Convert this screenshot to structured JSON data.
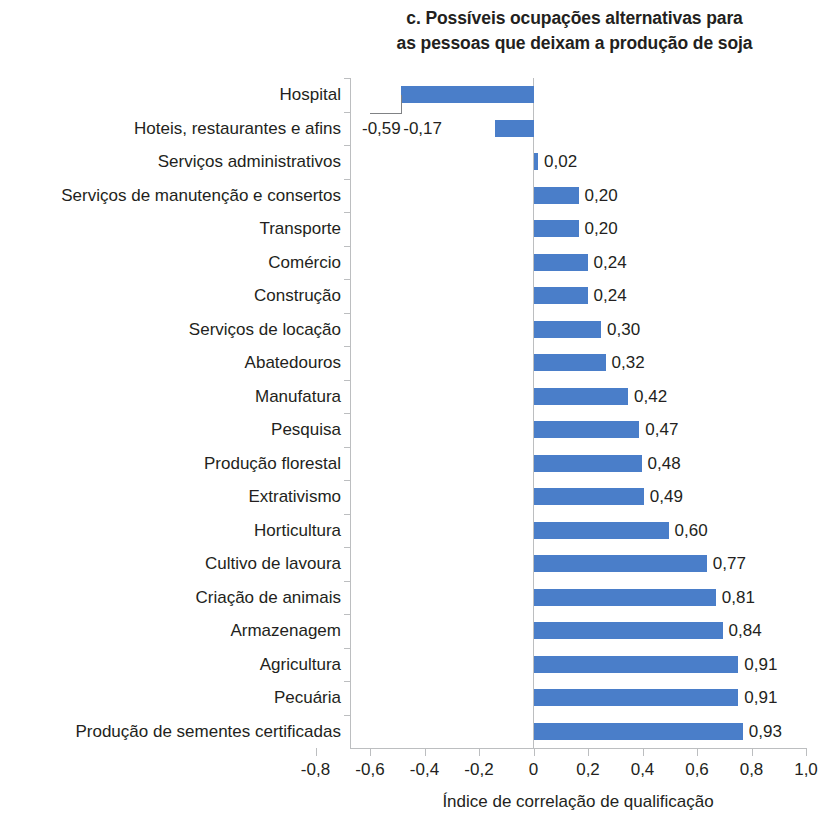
{
  "chart_data": {
    "type": "bar",
    "orientation": "horizontal",
    "title": "c. Possíveis ocupações alternativas para as pessoas que deixam a produção de soja",
    "title_lines": [
      "c. Possíveis ocupações alternativas para",
      "as pessoas que deixam a produção de soja"
    ],
    "xlabel": "Índice de correlação de qualificação",
    "ylabel": "",
    "xlim": [
      -0.8,
      1.0
    ],
    "grid": false,
    "legend": null,
    "bar_color": "#4a7ec9",
    "decimal_separator": ",",
    "xticks": [
      -0.8,
      -0.6,
      -0.4,
      -0.2,
      0,
      0.2,
      0.4,
      0.6,
      0.8,
      1.0
    ],
    "xtick_labels": [
      "-0,8",
      "-0,6",
      "-0,4",
      "-0,2",
      "0",
      "0,2",
      "0,4",
      "0,6",
      "0,8",
      "1,0"
    ],
    "categories": [
      "Hospital",
      "Hoteis, restaurantes e afins",
      "Serviços administrativos",
      "Serviços de manutenção e consertos",
      "Transporte",
      "Comércio",
      "Construção",
      "Serviços de locação",
      "Abatedouros",
      "Manufatura",
      "Pesquisa",
      "Produção florestal",
      "Extrativismo",
      "Horticultura",
      "Cultivo de lavoura",
      "Criação de animais",
      "Armazenagem",
      "Agricultura",
      "Pecuária",
      "Produção de sementes certificadas"
    ],
    "values": [
      -0.59,
      -0.17,
      0.02,
      0.2,
      0.2,
      0.24,
      0.24,
      0.3,
      0.32,
      0.42,
      0.47,
      0.48,
      0.49,
      0.6,
      0.77,
      0.81,
      0.84,
      0.91,
      0.91,
      0.93
    ],
    "value_labels": [
      "-0,59",
      "-0,17",
      "0,02",
      "0,20",
      "0,20",
      "0,24",
      "0,24",
      "0,30",
      "0,32",
      "0,42",
      "0,47",
      "0,48",
      "0,49",
      "0,60",
      "0,77",
      "0,81",
      "0,84",
      "0,91",
      "0,91",
      "0,93"
    ]
  }
}
